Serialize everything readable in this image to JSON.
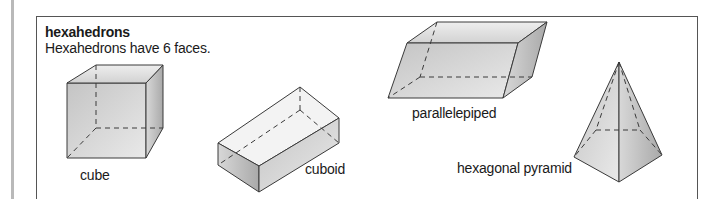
{
  "section": {
    "title": "hexahedrons",
    "description": "Hexahedrons have 6 faces."
  },
  "shapes": [
    {
      "name": "cube",
      "label": "cube"
    },
    {
      "name": "cuboid",
      "label": "cuboid"
    },
    {
      "name": "parallelepiped",
      "label": "parallelepiped"
    },
    {
      "name": "pyramid",
      "label": "hexagonal pyramid"
    }
  ],
  "colors": {
    "frame": "#555555",
    "edge": "#3a3a3a",
    "face_light": "#e6e6e6",
    "face_mid": "#cfcfcf",
    "face_dark": "#b5b5b5"
  }
}
